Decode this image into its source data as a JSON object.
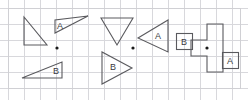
{
  "document": {
    "title": "Rotation of figures about a point",
    "width": 248,
    "height": 100,
    "background_color": "#ffffff"
  },
  "grid": {
    "line_color": "#d8d8dc",
    "cell_size": 16,
    "origin_x": 8,
    "origin_y": 8,
    "columns": 15,
    "rows": 5,
    "frame_color": "#d0d0d4",
    "frame": {
      "x": 8,
      "y": 8,
      "width": 232,
      "height": 80
    }
  },
  "style": {
    "shape_stroke_color": "#5a5a5e",
    "shape_stroke_width": 1.1,
    "shape_fill": "none",
    "label_color": "#3a3a3e",
    "label_font_size": 9,
    "center_dot_color": "#1a1a1a",
    "center_dot_radius": 1.6
  },
  "panels": [
    {
      "id": "panel-1",
      "name": "panel-left",
      "center_point": {
        "label": "",
        "x": 57,
        "y": 48
      },
      "shapes": [
        {
          "id": "p1-preimage",
          "name": "triangle-preimage",
          "kind": "triangle",
          "label": "",
          "points": "24,17 24,45 47,45",
          "description": "right triangle, vertical left leg, horizontal bottom leg, hypotenuse top-left to bottom-right"
        },
        {
          "id": "p1-image-a",
          "name": "triangle-a",
          "kind": "triangle",
          "label": "A",
          "label_x": 60,
          "label_y": 27,
          "points": "55,20 55,33 88,16",
          "description": "thin triangle pointing right, vertical short left edge"
        },
        {
          "id": "p1-image-b",
          "name": "triangle-b",
          "kind": "triangle",
          "label": "B",
          "label_x": 56,
          "label_y": 72,
          "points": "22,78 62,78 62,62",
          "description": "thin triangle pointing left, vertical short right edge"
        }
      ]
    },
    {
      "id": "panel-2",
      "name": "panel-middle",
      "center_point": {
        "label": "",
        "x": 133,
        "y": 48
      },
      "shapes": [
        {
          "id": "p2-preimage",
          "name": "triangle-preimage",
          "kind": "triangle",
          "label": "",
          "points": "101,18 133,18 117,45",
          "description": "triangle pointing down, horizontal top edge"
        },
        {
          "id": "p2-image-a",
          "name": "triangle-a",
          "kind": "triangle",
          "label": "A",
          "label_x": 158,
          "label_y": 37,
          "points": "138,38 168,20 168,52",
          "description": "triangle pointing left, vertical right edge"
        },
        {
          "id": "p2-image-b",
          "name": "triangle-b",
          "kind": "triangle",
          "label": "B",
          "label_x": 113,
          "label_y": 68,
          "points": "102,52 102,84 132,68",
          "description": "triangle pointing right, vertical left edge"
        }
      ]
    },
    {
      "id": "panel-3",
      "name": "panel-right",
      "center_point": {
        "label": "",
        "x": 207,
        "y": 48
      },
      "shapes": [
        {
          "id": "p3-preimage",
          "name": "rectilinear-preimage",
          "kind": "polygon",
          "label": "",
          "points": "191,40 191,56 207,56 207,72 223,72 223,24 207,24 207,40",
          "description": "L / T shaped rectilinear figure made of unit squares"
        },
        {
          "id": "p3-image-b",
          "name": "square-b",
          "kind": "rect",
          "label": "B",
          "label_x": 184,
          "label_y": 43,
          "rect": {
            "x": 176,
            "y": 33,
            "width": 16,
            "height": 16
          },
          "description": "unit square labelled B at the left"
        },
        {
          "id": "p3-image-a",
          "name": "square-a",
          "kind": "rect",
          "label": "A",
          "label_x": 230,
          "label_y": 62,
          "rect": {
            "x": 222,
            "y": 52,
            "width": 16,
            "height": 16
          },
          "description": "unit square labelled A at the bottom right"
        }
      ]
    }
  ]
}
